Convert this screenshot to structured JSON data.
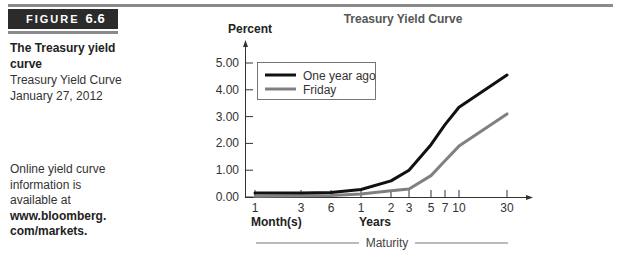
{
  "figure": {
    "label": "FIGURE",
    "number": "6.6"
  },
  "sidebar": {
    "title": "The Treasury yield curve",
    "subtitle_line1": "Treasury Yield Curve",
    "subtitle_line2": "January 27, 2012",
    "note_lines": [
      "Online yield curve",
      "information is",
      "available at"
    ],
    "note_link_line1": "www.bloomberg.",
    "note_link_line2": "com/markets."
  },
  "chart_data": {
    "type": "line",
    "title": "Treasury Yield Curve",
    "ylabel": "Percent",
    "xlabel": "Maturity",
    "x_group_labels": [
      "Month(s)",
      "Years"
    ],
    "categories": [
      "1 mo",
      "3 mo",
      "6 mo",
      "1 yr",
      "2 yr",
      "3 yr",
      "5 yr",
      "7 yr",
      "10 yr",
      "30 yr"
    ],
    "x_tick_labels": [
      "1",
      "3",
      "6",
      "1",
      "2",
      "3",
      "5",
      "7",
      "10",
      "30"
    ],
    "y_tick_labels": [
      "0.00",
      "1.00",
      "2.00",
      "3.00",
      "4.00",
      "5.00"
    ],
    "ylim": [
      0,
      5.5
    ],
    "grid": false,
    "legend_position": "upper-left",
    "series": [
      {
        "name": "One year ago",
        "color": "#111111",
        "values": [
          0.15,
          0.15,
          0.17,
          0.28,
          0.6,
          1.0,
          1.95,
          2.7,
          3.35,
          4.55
        ]
      },
      {
        "name": "Friday",
        "color": "#808080",
        "values": [
          0.03,
          0.05,
          0.06,
          0.11,
          0.23,
          0.3,
          0.8,
          1.35,
          1.9,
          3.1
        ]
      }
    ]
  }
}
